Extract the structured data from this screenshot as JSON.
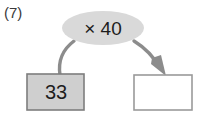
{
  "worksheet": {
    "question_number": "(7)",
    "background_color": "#ffffff"
  },
  "diagram": {
    "type": "function-machine",
    "operation_node": {
      "label": "× 40",
      "shape": "ellipse",
      "fill_color": "#d9d9d9",
      "text_color": "#1d1d1d"
    },
    "input_box": {
      "value": "33",
      "fill_color": "#cfcfcf",
      "border_color": "#7d7d7d",
      "text_color": "#1d1d1d"
    },
    "output_box": {
      "value": "",
      "fill_color": "#ffffff",
      "border_color": "#9a9a9a",
      "text_color": "#1d1d1d"
    },
    "connectors": {
      "input_curve_color": "#8c8c8c",
      "output_arrow_color": "#8c8c8c"
    }
  }
}
